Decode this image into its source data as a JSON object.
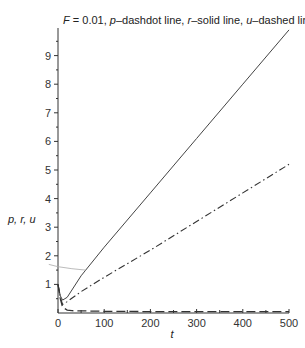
{
  "chart_data": {
    "type": "line",
    "title": "F = 0.01, p–dashdot line, r–solid line, u–dashed line",
    "title_parts": {
      "F": "F",
      "eq": " = 0.01, ",
      "p": "p",
      "p_desc": "–dashdot line, ",
      "r": "r",
      "r_desc": "–solid line, ",
      "u": "u",
      "u_desc": "–dashed line"
    },
    "xlabel": "t",
    "ylabel": "p, r, u",
    "xlim": [
      0,
      500
    ],
    "ylim": [
      0,
      10
    ],
    "xticks": [
      0,
      100,
      200,
      300,
      400,
      500
    ],
    "yticks": [
      1,
      2,
      3,
      4,
      5,
      6,
      7,
      8,
      9
    ],
    "grid": false,
    "legend": "in title",
    "series": [
      {
        "name": "r",
        "style": "solid",
        "x": [
          0,
          5,
          10,
          20,
          50,
          100,
          200,
          300,
          400,
          500
        ],
        "y": [
          1.0,
          0.6,
          0.45,
          0.55,
          1.3,
          2.3,
          4.2,
          6.1,
          8.0,
          9.9
        ]
      },
      {
        "name": "p",
        "style": "dashdot",
        "x": [
          0,
          5,
          10,
          20,
          50,
          100,
          200,
          300,
          400,
          500
        ],
        "y": [
          1.0,
          0.55,
          0.3,
          0.4,
          0.75,
          1.25,
          2.2,
          3.2,
          4.2,
          5.2
        ]
      },
      {
        "name": "u",
        "style": "dashed",
        "x": [
          0,
          5,
          10,
          20,
          30,
          100,
          200,
          300,
          400,
          500
        ],
        "y": [
          1.0,
          0.5,
          0.2,
          0.1,
          0.08,
          0.06,
          0.05,
          0.05,
          0.05,
          0.05
        ]
      },
      {
        "name": "reference (grey)",
        "style": "thin-grey",
        "x": [
          -20,
          0,
          30,
          60
        ],
        "y": [
          1.7,
          1.62,
          1.55,
          1.5
        ]
      }
    ]
  }
}
